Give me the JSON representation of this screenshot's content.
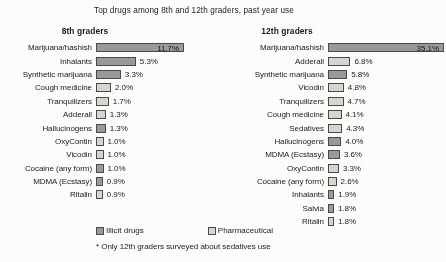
{
  "chart_data": {
    "type": "bar",
    "title": "Top drugs among 8th and 12th graders, past year use",
    "xlabel": "",
    "ylabel": "",
    "orientation": "horizontal",
    "grid": false,
    "legend_position": "bottom",
    "footnote": "* Only 12th graders surveyed about sedatives use",
    "legend": [
      {
        "label": "Illicit drugs",
        "color": "#9a9a9a",
        "key": "illicit"
      },
      {
        "label": "Pharmaceutical",
        "color": "#d6d6d2",
        "key": "pharma"
      }
    ],
    "panels": [
      {
        "header": "8th graders",
        "axis_max": 11.7,
        "categories": [
          "Marijuana/hashish",
          "Inhalants",
          "Synthetic marijuana",
          "Cough medicine",
          "Tranquilizers",
          "Adderall",
          "Hallucinogens",
          "OxyContin",
          "Vicodin",
          "Cocaine (any form)",
          "MDMA (Ecstasy)",
          "Ritalin"
        ],
        "values": [
          11.7,
          5.3,
          3.3,
          2.0,
          1.7,
          1.3,
          1.3,
          1.0,
          1.0,
          1.0,
          0.9,
          0.9
        ],
        "value_labels": [
          "11.7%",
          "5.3%",
          "3.3%",
          "2.0%",
          "1.7%",
          "1.3%",
          "1.3%",
          "1.0%",
          "1.0%",
          "1.0%",
          "0.9%",
          "0.9%"
        ],
        "types": [
          "illicit",
          "illicit",
          "illicit",
          "pharma",
          "pharma",
          "pharma",
          "illicit",
          "pharma",
          "pharma",
          "illicit",
          "illicit",
          "pharma"
        ]
      },
      {
        "header": "12th graders",
        "axis_max": 35.1,
        "categories": [
          "Marijuana/hashish",
          "Adderall",
          "Synthetic marijuana",
          "Vicodin",
          "Tranquilizers",
          "Cough medicine",
          "Sedatives",
          "Hallucinogens",
          "MDMA (Ecstasy)",
          "OxyContin",
          "Cocaine (any form)",
          "Inhalants",
          "Salvia",
          "Ritalin"
        ],
        "values": [
          35.1,
          6.8,
          5.8,
          4.8,
          4.7,
          4.1,
          4.3,
          4.0,
          3.6,
          3.3,
          2.6,
          1.9,
          1.8,
          1.8
        ],
        "value_labels": [
          "35.1%",
          "6.8%",
          "5.8%",
          "4.8%",
          "4.7%",
          "4.1%",
          "4.3%",
          "4.0%",
          "3.6%",
          "3.3%",
          "2.6%",
          "1.9%",
          "1.8%",
          "1.8%"
        ],
        "types": [
          "illicit",
          "pharma",
          "illicit",
          "pharma",
          "pharma",
          "pharma",
          "pharma",
          "illicit",
          "illicit",
          "pharma",
          "pharma",
          "illicit",
          "illicit",
          "pharma"
        ]
      }
    ]
  }
}
